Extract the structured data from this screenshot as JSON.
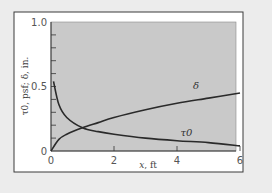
{
  "chart_data": {
    "type": "line",
    "title": "",
    "xlabel": "x, ft",
    "ylabel": "τ0, psf; δ, in.",
    "xlim": [
      0,
      6.15
    ],
    "ylim": [
      0,
      1.0
    ],
    "x_ticks": [
      0,
      2,
      4,
      6
    ],
    "x_tick_labels": [
      "0",
      "2",
      "4",
      "6"
    ],
    "y_ticks": [
      0,
      0.5,
      1.0
    ],
    "y_tick_labels": [
      "0",
      "0.5",
      "1.0"
    ],
    "y_minor_tick_step": 0.1,
    "grid": false,
    "legend": "none (inline curve labels)",
    "series": [
      {
        "name": "δ",
        "label": "δ",
        "x": [
          0,
          0.25,
          0.5,
          1,
          1.5,
          2,
          3,
          4,
          5,
          6
        ],
        "values": [
          0,
          0.09,
          0.13,
          0.18,
          0.22,
          0.26,
          0.32,
          0.37,
          0.41,
          0.45
        ],
        "label_position": {
          "x": 4.6,
          "y": 0.48
        }
      },
      {
        "name": "τ0",
        "label": "τ0",
        "x": [
          0.08,
          0.25,
          0.5,
          1,
          1.5,
          2,
          3,
          4,
          5,
          6
        ],
        "values": [
          0.54,
          0.36,
          0.26,
          0.18,
          0.15,
          0.13,
          0.1,
          0.08,
          0.065,
          0.04
        ],
        "label_position": {
          "x": 4.3,
          "y": 0.12
        }
      }
    ]
  },
  "colors": {
    "page_background": "#ececec",
    "frame_fill": "#ffffff",
    "frame_border": "#3a3a3a",
    "plot_fill": "#c9c9c9",
    "curve": "#2a2a2a",
    "text": "#555555"
  }
}
